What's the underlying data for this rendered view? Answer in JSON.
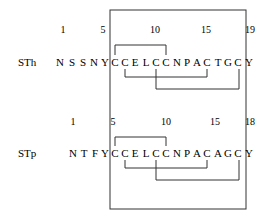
{
  "diagram": {
    "rows": [
      {
        "label": "STh",
        "numbers": [
          {
            "text": "1",
            "x": 63
          },
          {
            "text": "5",
            "x": 103
          },
          {
            "text": "10",
            "x": 155
          },
          {
            "text": "15",
            "x": 206
          },
          {
            "text": "19",
            "x": 250
          }
        ],
        "residues": [
          "N",
          "S",
          "S",
          "N",
          "Y",
          "C",
          "C",
          "E",
          "L",
          "C",
          "C",
          "N",
          "P",
          "A",
          "C",
          "T",
          "G",
          "C",
          "Y"
        ],
        "residue_x": [
          60,
          72,
          83,
          94,
          105,
          115,
          125,
          135,
          146,
          156,
          166,
          177,
          187,
          197,
          207,
          218,
          228,
          238,
          249
        ]
      },
      {
        "label": "STp",
        "numbers": [
          {
            "text": "1",
            "x": 73
          },
          {
            "text": "5",
            "x": 113
          },
          {
            "text": "10",
            "x": 166
          },
          {
            "text": "15",
            "x": 215
          },
          {
            "text": "18",
            "x": 250
          }
        ],
        "residues": [
          "N",
          "T",
          "F",
          "Y",
          "C",
          "C",
          "E",
          "L",
          "C",
          "C",
          "N",
          "P",
          "A",
          "C",
          "A",
          "G",
          "C",
          "Y"
        ],
        "residue_x": [
          73,
          84,
          95,
          105,
          115,
          125,
          135,
          146,
          156,
          166,
          177,
          187,
          197,
          207,
          218,
          228,
          238,
          249
        ]
      }
    ],
    "disulfide_bonds": [
      {
        "row": 0,
        "from": "C6",
        "to": "C11"
      },
      {
        "row": 0,
        "from": "C7",
        "to": "C15"
      },
      {
        "row": 0,
        "from": "C10",
        "to": "C18"
      },
      {
        "row": 1,
        "from": "C5",
        "to": "C10"
      },
      {
        "row": 1,
        "from": "C6",
        "to": "C14"
      },
      {
        "row": 1,
        "from": "C9",
        "to": "C17"
      }
    ],
    "box_note": "enclosed toxic domain (residues C..C)"
  }
}
